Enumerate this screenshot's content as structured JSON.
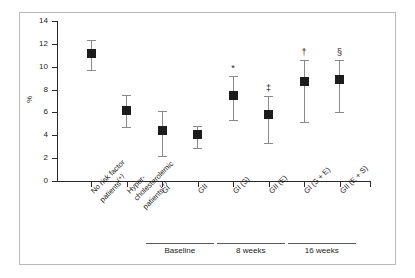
{
  "chart_data": {
    "type": "scatter",
    "title": "",
    "xlabel": "",
    "ylabel": "%",
    "ylim": [
      0,
      14
    ],
    "yticks": [
      0,
      2,
      4,
      6,
      8,
      10,
      12,
      14
    ],
    "ytick_labels": [
      "0",
      "2",
      "4",
      "6",
      "8",
      "10",
      "12",
      "14"
    ],
    "grid": false,
    "legend": "none",
    "error_bars": "vertical, capped",
    "marker": "filled black square",
    "categories": [
      "No risk factor patients⁽⁺⁾",
      "Hyper-cholesterolemic patients⁽⁺⁾",
      "GI",
      "GII",
      "GI (S)",
      "GII (E)",
      "GI (S + E)",
      "GII (E + S)"
    ],
    "points": [
      {
        "label": "No risk factor patients",
        "label_line1": "No risk factor",
        "label_line2": "patients",
        "label_sup": "(+)",
        "value": 11.2,
        "low": 9.7,
        "high": 12.3,
        "significance": ""
      },
      {
        "label": "Hyper-cholesterolemic patients",
        "label_line1": "Hyper-",
        "label_line2": "cholesterolemic",
        "label_line3": "patients",
        "label_sup": "(+)",
        "value": 6.2,
        "low": 4.7,
        "high": 7.5,
        "significance": ""
      },
      {
        "label": "GI",
        "label_line1": "GI",
        "label_sup": "",
        "value": 4.4,
        "low": 2.2,
        "high": 6.1,
        "significance": ""
      },
      {
        "label": "GII",
        "label_line1": "GII",
        "label_sup": "",
        "value": 4.1,
        "low": 2.9,
        "high": 4.8,
        "significance": ""
      },
      {
        "label": "GI (S)",
        "label_line1": "GI (S)",
        "label_sup": "",
        "value": 7.5,
        "low": 5.3,
        "high": 9.2,
        "significance": "*"
      },
      {
        "label": "GII (E)",
        "label_line1": "GII (E)",
        "label_sup": "",
        "value": 5.8,
        "low": 3.3,
        "high": 7.4,
        "significance": "‡"
      },
      {
        "label": "GI (S + E)",
        "label_line1": "GI (S + E)",
        "label_sup": "",
        "value": 8.7,
        "low": 5.2,
        "high": 10.6,
        "significance": "†"
      },
      {
        "label": "GII (E + S)",
        "label_line1": "GII (E + S)",
        "label_sup": "",
        "value": 8.9,
        "low": 6.0,
        "high": 10.6,
        "significance": "§"
      }
    ],
    "groups": [
      {
        "label": "Baseline",
        "from_index": 2,
        "to_index": 3
      },
      {
        "label": "8 weeks",
        "from_index": 4,
        "to_index": 5
      },
      {
        "label": "16 weeks",
        "from_index": 6,
        "to_index": 7
      }
    ]
  }
}
